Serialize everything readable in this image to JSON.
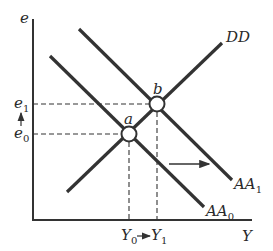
{
  "diagram": {
    "axes": {
      "y_label": "e",
      "x_label": "Y"
    },
    "curves": {
      "dd": {
        "label": "DD"
      },
      "aa0": {
        "label_main": "AA",
        "label_sub": "0"
      },
      "aa1": {
        "label_main": "AA",
        "label_sub": "1"
      }
    },
    "points": {
      "a": {
        "label": "a"
      },
      "b": {
        "label": "b"
      }
    },
    "y_ticks": {
      "e1": {
        "main": "e",
        "sub": "1"
      },
      "e0": {
        "main": "e",
        "sub": "0"
      }
    },
    "x_ticks": {
      "y0": {
        "main": "Y",
        "sub": "0"
      },
      "y1": {
        "main": "Y",
        "sub": "1"
      }
    },
    "colors": {
      "line": "#333333",
      "dash": "#333333",
      "background": "#ffffff"
    }
  }
}
